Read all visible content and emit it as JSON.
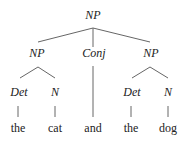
{
  "tree": {
    "root": "NP",
    "np1": "NP",
    "conj": "Conj",
    "np2": "NP",
    "det1": "Det",
    "n1": "N",
    "det2": "Det",
    "n2": "N",
    "words": [
      "the",
      "cat",
      "and",
      "the",
      "dog"
    ]
  },
  "colors": {
    "line": "#666666",
    "text": "#222222"
  }
}
